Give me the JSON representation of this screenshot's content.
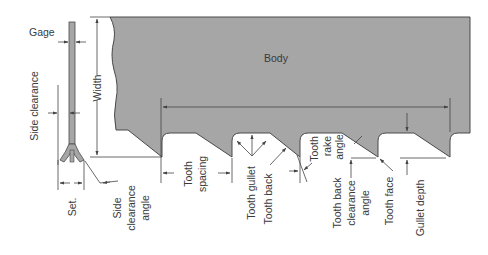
{
  "diagram": {
    "colors": {
      "blade_fill": "#a6a6a6",
      "outline": "#4a4a4a",
      "line": "#555555",
      "text": "#3a3a3a",
      "background": "#ffffff"
    },
    "labels": {
      "gage": "Gage",
      "side_clearance": "Side clearance",
      "width": "Width",
      "body": "Body",
      "set": "Set.",
      "side_clearance_angle_1": "Side",
      "side_clearance_angle_2": "clearance",
      "side_clearance_angle_3": "angle",
      "tooth_spacing_1": "Tooth",
      "tooth_spacing_2": "spacing",
      "tooth_gullet": "Tooth gullet",
      "tooth_back": "Tooth back",
      "tooth_rake_angle_1": "Tooth",
      "tooth_rake_angle_2": "rake",
      "tooth_rake_angle_3": "angle",
      "tooth_back_clearance_angle_1": "Tooth back",
      "tooth_back_clearance_angle_2": "clearance",
      "tooth_back_clearance_angle_3": "angle",
      "tooth_face": "Tooth face",
      "gullet_depth": "Gullet depth"
    }
  }
}
